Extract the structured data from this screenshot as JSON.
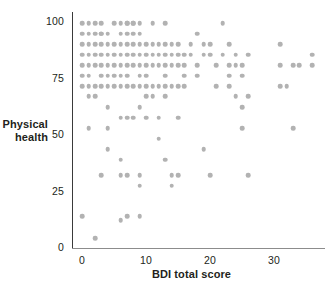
{
  "chart_data": {
    "type": "scatter",
    "title": "",
    "xlabel": "BDI total score",
    "ylabel_line1": "Physical",
    "ylabel_line2": "health",
    "xlim": [
      -1.6,
      38.0
    ],
    "ylim": [
      -2.0,
      105.0
    ],
    "xticks": [
      0,
      10,
      20,
      30
    ],
    "xtick_labels": [
      "0",
      "10",
      "20",
      "30"
    ],
    "yticks": [
      0,
      25,
      50,
      75,
      100
    ],
    "ytick_labels": [
      "0",
      "25",
      "50",
      "75",
      "100"
    ],
    "grid": false,
    "legend": "none",
    "marker_color": "#b2b2b2",
    "axis_color": "#3a3a3a",
    "points": [
      [
        0,
        100
      ],
      [
        1,
        100
      ],
      [
        2,
        100
      ],
      [
        3,
        100
      ],
      [
        3,
        95.2
      ],
      [
        5,
        100
      ],
      [
        6,
        100
      ],
      [
        7,
        100
      ],
      [
        8,
        100
      ],
      [
        9,
        100
      ],
      [
        11,
        100
      ],
      [
        13,
        100
      ],
      [
        22,
        100
      ],
      [
        0,
        95.2
      ],
      [
        1,
        95.2
      ],
      [
        2,
        95.2
      ],
      [
        3,
        95.2
      ],
      [
        4,
        95.2
      ],
      [
        6,
        95.2
      ],
      [
        7,
        95.2
      ],
      [
        7,
        100
      ],
      [
        8,
        95.2
      ],
      [
        8,
        100
      ],
      [
        9,
        95.2
      ],
      [
        18,
        95.2
      ],
      [
        0,
        90.5
      ],
      [
        1,
        90.5
      ],
      [
        2,
        90.5
      ],
      [
        3,
        90.5
      ],
      [
        4,
        90.5
      ],
      [
        5,
        90.5
      ],
      [
        6,
        90.5
      ],
      [
        7,
        90.5
      ],
      [
        8,
        90.5
      ],
      [
        9,
        90.5
      ],
      [
        10,
        90.5
      ],
      [
        11,
        90.5
      ],
      [
        12,
        90.5
      ],
      [
        13,
        90.5
      ],
      [
        14,
        90.5
      ],
      [
        15,
        90.5
      ],
      [
        17,
        90.5
      ],
      [
        19,
        90.5
      ],
      [
        20,
        90.5
      ],
      [
        23,
        90.5
      ],
      [
        31,
        90.5
      ],
      [
        0,
        85.7
      ],
      [
        1,
        85.7
      ],
      [
        2,
        85.7
      ],
      [
        3,
        85.7
      ],
      [
        4,
        85.7
      ],
      [
        5,
        85.7
      ],
      [
        6,
        85.7
      ],
      [
        7,
        85.7
      ],
      [
        8,
        85.7
      ],
      [
        9,
        85.7
      ],
      [
        10,
        85.7
      ],
      [
        11,
        85.7
      ],
      [
        12,
        85.7
      ],
      [
        13,
        85.7
      ],
      [
        14,
        85.7
      ],
      [
        15,
        85.7
      ],
      [
        16,
        85.7
      ],
      [
        17,
        85.7
      ],
      [
        19,
        85.7
      ],
      [
        20,
        85.7
      ],
      [
        22,
        85.7
      ],
      [
        24,
        85.7
      ],
      [
        26,
        85.7
      ],
      [
        36,
        85.7
      ],
      [
        0,
        81
      ],
      [
        1,
        81
      ],
      [
        2,
        81
      ],
      [
        3,
        81
      ],
      [
        4,
        81
      ],
      [
        5,
        81
      ],
      [
        6,
        81
      ],
      [
        7,
        81
      ],
      [
        8,
        81
      ],
      [
        9,
        81
      ],
      [
        10,
        81
      ],
      [
        11,
        81
      ],
      [
        12,
        81
      ],
      [
        13,
        81
      ],
      [
        14,
        81
      ],
      [
        15,
        81
      ],
      [
        16,
        81
      ],
      [
        18,
        81
      ],
      [
        21,
        81
      ],
      [
        23,
        81
      ],
      [
        24,
        81
      ],
      [
        25,
        81
      ],
      [
        31,
        81
      ],
      [
        33,
        81
      ],
      [
        34,
        81
      ],
      [
        36,
        81
      ],
      [
        0,
        76.2
      ],
      [
        1,
        76.2
      ],
      [
        3,
        76.2
      ],
      [
        4,
        76.2
      ],
      [
        5,
        76.2
      ],
      [
        6,
        76.2
      ],
      [
        7,
        76.2
      ],
      [
        9,
        76.2
      ],
      [
        10,
        76.2
      ],
      [
        13,
        76.2
      ],
      [
        16,
        76.2
      ],
      [
        18,
        76.2
      ],
      [
        23,
        76.2
      ],
      [
        25,
        76.2
      ],
      [
        0,
        71.4
      ],
      [
        1,
        71.4
      ],
      [
        2,
        71.4
      ],
      [
        3,
        71.4
      ],
      [
        4,
        71.4
      ],
      [
        5,
        71.4
      ],
      [
        6,
        71.4
      ],
      [
        7,
        71.4
      ],
      [
        8,
        71.4
      ],
      [
        9,
        71.4
      ],
      [
        10,
        71.4
      ],
      [
        11,
        71.4
      ],
      [
        12,
        71.4
      ],
      [
        13,
        71.4
      ],
      [
        14,
        71.4
      ],
      [
        15,
        71.4
      ],
      [
        16,
        71.4
      ],
      [
        21,
        71.4
      ],
      [
        23,
        71.4
      ],
      [
        31,
        71.4
      ],
      [
        32,
        71.4
      ],
      [
        1,
        66.7
      ],
      [
        2,
        66.7
      ],
      [
        10,
        66.7
      ],
      [
        11,
        66.7
      ],
      [
        13,
        66.7
      ],
      [
        24,
        66.7
      ],
      [
        26,
        66.7
      ],
      [
        4,
        61.9
      ],
      [
        9,
        61.9
      ],
      [
        25,
        61.9
      ],
      [
        6,
        57.1
      ],
      [
        7,
        57.1
      ],
      [
        8,
        57.1
      ],
      [
        10,
        57.1
      ],
      [
        12,
        57.1
      ],
      [
        15,
        57.1
      ],
      [
        1,
        52.4
      ],
      [
        4,
        52.4
      ],
      [
        25,
        52.4
      ],
      [
        33,
        52.4
      ],
      [
        12,
        47.6
      ],
      [
        4,
        42.9
      ],
      [
        19,
        42.9
      ],
      [
        6,
        38.1
      ],
      [
        13,
        38.1
      ],
      [
        3,
        31
      ],
      [
        6,
        31
      ],
      [
        7,
        31
      ],
      [
        9,
        31
      ],
      [
        14,
        31
      ],
      [
        15,
        31
      ],
      [
        20,
        31
      ],
      [
        26,
        31
      ],
      [
        9,
        26.2
      ],
      [
        14,
        26.2
      ],
      [
        0,
        12.5
      ],
      [
        6,
        10.5
      ],
      [
        7,
        12.5
      ],
      [
        9,
        12.5
      ],
      [
        2,
        2.5
      ]
    ]
  },
  "axis": {
    "y_title_line1": "Physical",
    "y_title_line2": "health",
    "x_title": "BDI total score"
  }
}
